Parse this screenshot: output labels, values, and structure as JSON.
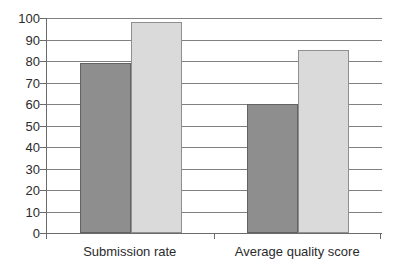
{
  "chart_data": {
    "type": "bar",
    "title": "",
    "subtitle": "",
    "xlabel": "",
    "ylabel": "",
    "categories": [
      "Submission rate",
      "Average quality score"
    ],
    "series": [
      {
        "name": "series-1",
        "color": "#8e8e8e",
        "values": [
          79,
          60
        ]
      },
      {
        "name": "series-2",
        "color": "#dadada",
        "values": [
          98,
          85
        ]
      }
    ],
    "ylim": [
      0,
      100
    ],
    "ytick_values": [
      0,
      10,
      20,
      30,
      40,
      50,
      60,
      70,
      80,
      90,
      100
    ],
    "ytick_labels": [
      "0",
      "10",
      "20",
      "30",
      "40",
      "50",
      "60",
      "70",
      "80",
      "90",
      "100"
    ],
    "grid": true,
    "grid_axis": "y",
    "legend": false,
    "legend_position": "none",
    "annotations": []
  },
  "style": {
    "background": "#ffffff",
    "axis_color": "#6b6b6b",
    "grid_color": "#808080",
    "text_color": "#2b2b2b"
  }
}
